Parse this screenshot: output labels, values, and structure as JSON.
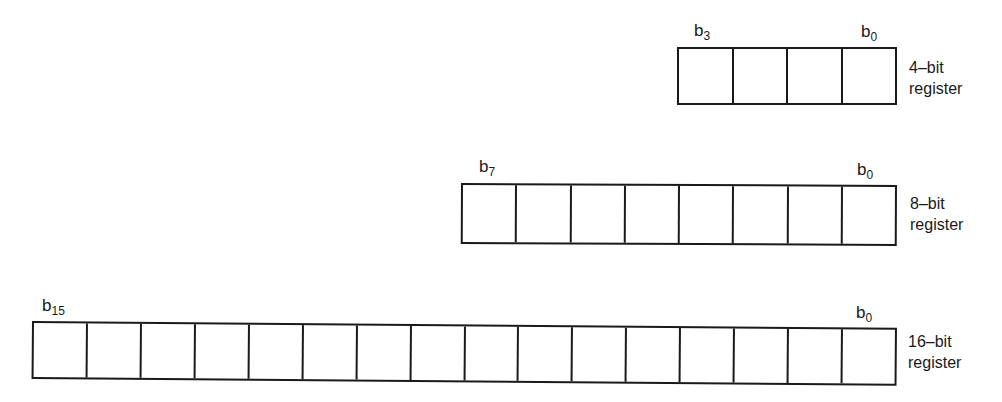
{
  "diagram": {
    "registers": [
      {
        "id": "reg4",
        "bits": 4,
        "msb_label": {
          "base": "b",
          "sub": "3"
        },
        "lsb_label": {
          "base": "b",
          "sub": "0"
        },
        "name_line1": "4–bit",
        "name_line2": "register"
      },
      {
        "id": "reg8",
        "bits": 8,
        "msb_label": {
          "base": "b",
          "sub": "7"
        },
        "lsb_label": {
          "base": "b",
          "sub": "0"
        },
        "name_line1": "8–bit",
        "name_line2": "register"
      },
      {
        "id": "reg16",
        "bits": 16,
        "msb_label": {
          "base": "b",
          "sub": "15"
        },
        "lsb_label": {
          "base": "b",
          "sub": "0"
        },
        "name_line1": "16–bit",
        "name_line2": "register"
      }
    ],
    "colors": {
      "line": "#1a1a1a",
      "background": "#ffffff"
    }
  }
}
